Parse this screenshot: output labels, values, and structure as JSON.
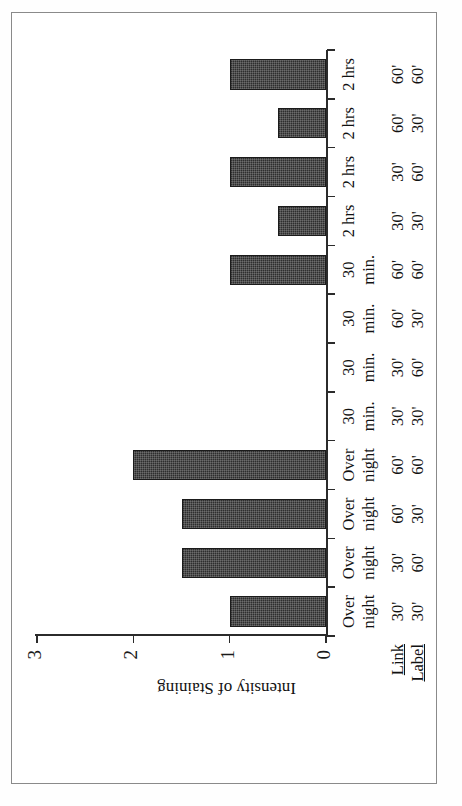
{
  "figure": {
    "orientation": "rotated-90-ccw",
    "frame_border_color": "#8a8a8a",
    "bar_color": "#2e2e2e",
    "axis_color": "#2b2b2b"
  },
  "row_headers": {
    "link": "Link",
    "label": "Label"
  },
  "chart_data": {
    "type": "bar",
    "title": "",
    "xlabel": "",
    "ylabel": "Intensity of Staining",
    "ylim": [
      0,
      3
    ],
    "yticks": [
      "0",
      "1",
      "2",
      "3"
    ],
    "ytick_values": [
      0,
      1,
      2,
      3
    ],
    "grid": false,
    "legend": "none",
    "categories": [
      "Over night / 30'",
      "Over night / 30'",
      "Over night / 60'",
      "Over night / 60'",
      "30 min. / 30'",
      "30 min. / 30'",
      "30 min. / 60'",
      "30 min. / 60'",
      "2 hrs / 30'",
      "2 hrs / 30'",
      "2 hrs / 60'",
      "2 hrs / 60'"
    ],
    "category_rows": {
      "link": [
        "Over night",
        "Over night",
        "Over night",
        "30 min.",
        "30 min.",
        "30 min.",
        "30 min.",
        "2 hrs",
        "2 hrs",
        "2 hrs",
        "2 hrs"
      ],
      "label": [
        "30' 30'",
        "30' 60'",
        "60' 30'",
        "60' 60'",
        "30' 30'",
        "30' 60'",
        "60' 30'",
        "60' 60'",
        "30' 30'",
        "30' 60'",
        "60' 30'",
        "60' 60'"
      ]
    },
    "columns": [
      {
        "link_top": "Over",
        "link_bot": "night",
        "label_top": "30'",
        "label_bot": "30'",
        "value": 1.0
      },
      {
        "link_top": "Over",
        "link_bot": "night",
        "label_top": "30'",
        "label_bot": "60'",
        "value": 1.5
      },
      {
        "link_top": "Over",
        "link_bot": "night",
        "label_top": "60'",
        "label_bot": "30'",
        "value": 1.5
      },
      {
        "link_top": "Over",
        "link_bot": "night",
        "label_top": "60'",
        "label_bot": "60'",
        "value": 2.0
      },
      {
        "link_top": "30",
        "link_bot": "min.",
        "label_top": "30'",
        "label_bot": "30'",
        "value": 0.0
      },
      {
        "link_top": "30",
        "link_bot": "min.",
        "label_top": "30'",
        "label_bot": "60'",
        "value": 0.0
      },
      {
        "link_top": "30",
        "link_bot": "min.",
        "label_top": "60'",
        "label_bot": "30'",
        "value": 0.0
      },
      {
        "link_top": "30",
        "link_bot": "min.",
        "label_top": "60'",
        "label_bot": "60'",
        "value": 1.0
      },
      {
        "link_top": "2 hrs",
        "link_bot": "",
        "label_top": "30'",
        "label_bot": "30'",
        "value": 0.5
      },
      {
        "link_top": "2 hrs",
        "link_bot": "",
        "label_top": "30'",
        "label_bot": "60'",
        "value": 1.0
      },
      {
        "link_top": "2 hrs",
        "link_bot": "",
        "label_top": "60'",
        "label_bot": "30'",
        "value": 0.5
      },
      {
        "link_top": "2 hrs",
        "link_bot": "",
        "label_top": "60'",
        "label_bot": "60'",
        "value": 1.0
      }
    ],
    "values": [
      1.0,
      1.5,
      1.5,
      2.0,
      0.0,
      0.0,
      0.0,
      1.0,
      0.5,
      1.0,
      0.5,
      1.0
    ]
  }
}
